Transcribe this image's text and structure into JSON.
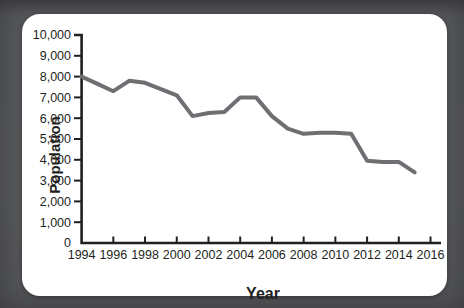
{
  "title": "DECLINE",
  "colors": {
    "frame": "#58595b",
    "card": "#ffffff",
    "axis": "#231f20",
    "line": "#6e6f72",
    "text": "#231f20"
  },
  "chart_data": {
    "type": "line",
    "title": "DECLINE",
    "xlabel": "Year",
    "ylabel": "Population",
    "x": [
      1994,
      1995,
      1996,
      1997,
      1998,
      1999,
      2000,
      2001,
      2002,
      2003,
      2004,
      2005,
      2006,
      2007,
      2008,
      2009,
      2010,
      2011,
      2012,
      2013,
      2014,
      2015
    ],
    "values": [
      8000,
      7650,
      7300,
      7800,
      7700,
      7400,
      7100,
      6100,
      6250,
      6300,
      7000,
      7000,
      6100,
      5500,
      5250,
      5300,
      5300,
      5250,
      3950,
      3900,
      3900,
      3400
    ],
    "series_name": "Population",
    "x_tick_labels": [
      "1994",
      "1996",
      "1998",
      "2000",
      "2002",
      "2004",
      "2006",
      "2008",
      "2010",
      "2012",
      "2014",
      "2016"
    ],
    "y_tick_labels": [
      "0",
      "1,000",
      "2,000",
      "3,000",
      "4,000",
      "5,000",
      "6,000",
      "7,000",
      "8,000",
      "9,000",
      "10,000"
    ],
    "xlim": [
      1994,
      2016.6
    ],
    "ylim": [
      0,
      10000
    ],
    "grid": false,
    "legend": false,
    "line_color": "#6e6f72"
  }
}
